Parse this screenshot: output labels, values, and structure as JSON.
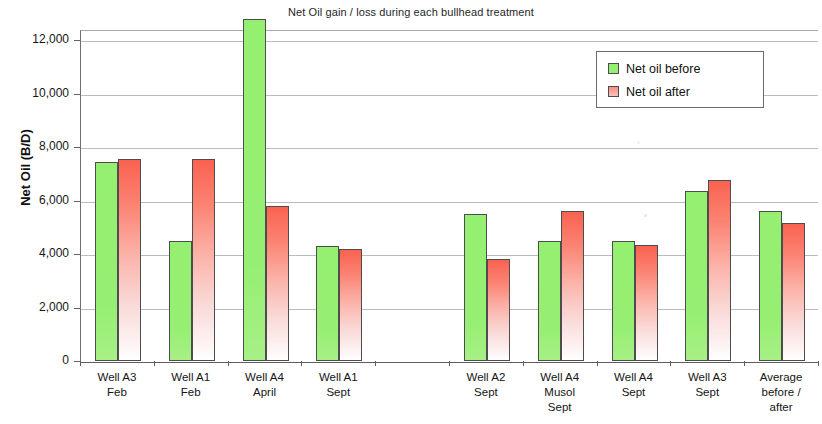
{
  "chart_data": {
    "type": "bar",
    "title": "Net Oil gain / loss during each bullhead treatment",
    "xlabel": "",
    "ylabel": "Net Oil (B/D)",
    "ylim": [
      0,
      13000
    ],
    "yticks": [
      "0",
      "2,000",
      "4,000",
      "6,000",
      "8,000",
      "10,000",
      "12,000"
    ],
    "ytick_values": [
      0,
      2000,
      4000,
      6000,
      8000,
      10000,
      12000
    ],
    "grid": true,
    "legend_position": "top-right",
    "categories": [
      "Well A3\nFeb",
      "Well A1\nFeb",
      "Well A4\nApril",
      "Well A1\nSept",
      "",
      "Well A2\nSept",
      "Well A4\nMusol\nSept",
      "Well A4\nSept",
      "Well A3\nSept",
      "Average\nbefore /\nafter"
    ],
    "category_lines": [
      [
        "Well A3",
        "Feb"
      ],
      [
        "Well A1",
        "Feb"
      ],
      [
        "Well A4",
        "April"
      ],
      [
        "Well A1",
        "Sept"
      ],
      [],
      [
        "Well A2",
        "Sept"
      ],
      [
        "Well A4",
        "Musol",
        "Sept"
      ],
      [
        "Well A4",
        "Sept"
      ],
      [
        "Well A3",
        "Sept"
      ],
      [
        "Average",
        "before /",
        "after"
      ]
    ],
    "series": [
      {
        "name": "Net oil before",
        "color": "#95ef70",
        "values": [
          7450,
          4500,
          12800,
          4300,
          null,
          5500,
          4500,
          4500,
          6350,
          5600
        ]
      },
      {
        "name": "Net oil after",
        "color": "#fa6250",
        "values": [
          7560,
          7560,
          5800,
          4200,
          null,
          3800,
          5600,
          4350,
          6750,
          5150
        ]
      }
    ]
  },
  "legend": {
    "items": [
      {
        "label": "Net oil before",
        "swatch": "before"
      },
      {
        "label": "Net oil after",
        "swatch": "after"
      }
    ]
  }
}
